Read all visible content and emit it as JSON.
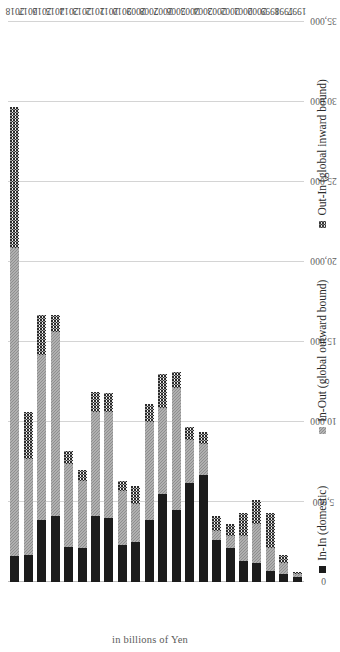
{
  "chart_data": {
    "type": "bar",
    "subtype": "stacked-horizontal",
    "orientation": "rotated-90-ccw",
    "title": "",
    "xlabel": "",
    "ylabel": "in billions of Yen",
    "ylim": [
      0,
      35000
    ],
    "ytick_labels": [
      "0",
      "5,000",
      "10,000",
      "15,000",
      "20,000",
      "25,000",
      "30,000",
      "35,000"
    ],
    "ytick_values": [
      0,
      5000,
      10000,
      15000,
      20000,
      25000,
      30000,
      35000
    ],
    "grid": true,
    "legend_position": "bottom",
    "categories": [
      "1997",
      "1998",
      "1999",
      "2000",
      "2001",
      "2002",
      "2003",
      "2004",
      "2005",
      "2006",
      "2007",
      "2008",
      "2009",
      "2010",
      "2011",
      "2012",
      "2013",
      "2014",
      "2015",
      "2016",
      "2017",
      "2018"
    ],
    "series": [
      {
        "name": "In-In (domestic)",
        "color": "#1c1c1c",
        "pattern": "solid",
        "values": [
          300,
          500,
          700,
          1200,
          1300,
          2100,
          2600,
          6700,
          6200,
          4500,
          5500,
          3900,
          2500,
          2300,
          4000,
          4100,
          2100,
          2200,
          4100,
          3900,
          1700,
          1600
        ]
      },
      {
        "name": "In-Out (global outward bound)",
        "color": "#8e8e8e",
        "pattern": "hatched",
        "values": [
          200,
          700,
          1400,
          2400,
          1600,
          800,
          600,
          1900,
          2700,
          7600,
          5400,
          6100,
          2400,
          3400,
          6600,
          6500,
          4200,
          5200,
          11500,
          10300,
          6000,
          19300
        ]
      },
      {
        "name": "Out-In (global inward bound)",
        "color": "#2b2b2b",
        "pattern": "checkered",
        "values": [
          100,
          500,
          2200,
          1500,
          1400,
          700,
          900,
          800,
          800,
          1000,
          2100,
          1100,
          1100,
          600,
          1200,
          1300,
          700,
          800,
          1100,
          2500,
          2900,
          8800
        ]
      }
    ],
    "totals": [
      600,
      1700,
      4300,
      5100,
      4300,
      3600,
      4100,
      9400,
      9700,
      13100,
      13000,
      11100,
      6000,
      6300,
      11800,
      11900,
      7000,
      8200,
      16700,
      16700,
      10600,
      29700
    ]
  },
  "legend": {
    "items": [
      {
        "label": "In-In (domestic)",
        "key": "in-in-key"
      },
      {
        "label": "In-Out (global outward bound)",
        "key": "in-out-key"
      },
      {
        "label": "Out-In (global inward bound)",
        "key": "out-in-key"
      }
    ]
  },
  "axis": {
    "value_axis_title": "in billions of Yen"
  },
  "colors": {
    "in_in": "#1c1c1c",
    "in_out": "#8e8e8e",
    "out_in": "#2b2b2b",
    "gridline": "#d4d4d4",
    "text": "#4a4a4a",
    "background": "#ffffff"
  }
}
